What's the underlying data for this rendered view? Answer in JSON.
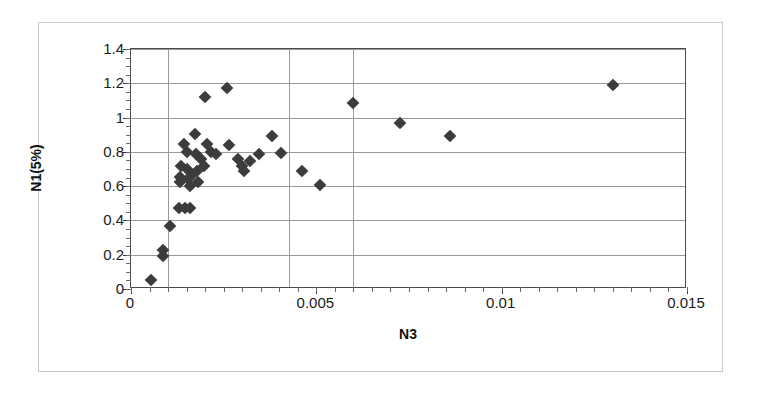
{
  "chart_data": {
    "type": "scatter",
    "title": "",
    "xlabel": "N3",
    "ylabel": "N1(5%)",
    "xlim": [
      0,
      0.015
    ],
    "ylim": [
      0,
      1.4
    ],
    "xticks": [
      "0",
      "0.005",
      "0.01",
      "0.015"
    ],
    "xtick_values": [
      0,
      0.005,
      0.01,
      0.015
    ],
    "yticks": [
      "0",
      "0.2",
      "0.4",
      "0.6",
      "0.8",
      "1",
      "1.2",
      "1.4"
    ],
    "ytick_values": [
      0,
      0.2,
      0.4,
      0.6,
      0.8,
      1,
      1.2,
      1.4
    ],
    "grid": "horizontal-major-and-three-vertical",
    "vertical_gridline_values": [
      0.001,
      0.00425,
      0.006
    ],
    "legend": null,
    "marker": "filled-diamond",
    "marker_color": "#3c3c3c",
    "series": [
      {
        "name": "N1(5%) vs N3",
        "points": [
          [
            0.00053,
            0.055
          ],
          [
            0.00085,
            0.225
          ],
          [
            0.00085,
            0.195
          ],
          [
            0.00105,
            0.365
          ],
          [
            0.0013,
            0.475
          ],
          [
            0.00146,
            0.475
          ],
          [
            0.0016,
            0.475
          ],
          [
            0.00133,
            0.655
          ],
          [
            0.00133,
            0.625
          ],
          [
            0.00136,
            0.72
          ],
          [
            0.00142,
            0.845
          ],
          [
            0.0015,
            0.8
          ],
          [
            0.00152,
            0.7
          ],
          [
            0.00155,
            0.64
          ],
          [
            0.0016,
            0.6
          ],
          [
            0.00165,
            0.665
          ],
          [
            0.00172,
            0.905
          ],
          [
            0.00175,
            0.79
          ],
          [
            0.00178,
            0.69
          ],
          [
            0.00182,
            0.625
          ],
          [
            0.0019,
            0.76
          ],
          [
            0.00196,
            0.72
          ],
          [
            0.002,
            1.12
          ],
          [
            0.00205,
            0.845
          ],
          [
            0.00215,
            0.8
          ],
          [
            0.0023,
            0.79
          ],
          [
            0.0026,
            1.17
          ],
          [
            0.00265,
            0.84
          ],
          [
            0.0029,
            0.76
          ],
          [
            0.003,
            0.715
          ],
          [
            0.00305,
            0.69
          ],
          [
            0.0032,
            0.745
          ],
          [
            0.00345,
            0.79
          ],
          [
            0.0038,
            0.89
          ],
          [
            0.00405,
            0.795
          ],
          [
            0.0046,
            0.69
          ],
          [
            0.0051,
            0.605
          ],
          [
            0.006,
            1.085
          ],
          [
            0.00725,
            0.97
          ],
          [
            0.0086,
            0.89
          ],
          [
            0.013,
            1.19
          ]
        ]
      }
    ]
  },
  "axes": {
    "x_label_text": "N3",
    "y_label_text": "N1(5%)"
  }
}
